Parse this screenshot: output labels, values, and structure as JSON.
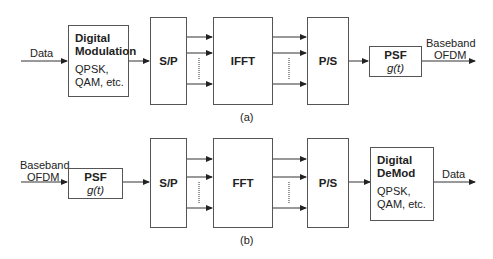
{
  "diagram_a": {
    "caption": "(a)",
    "input_label": "Data",
    "modulator": {
      "title_line1": "Digital",
      "title_line2": "Modulation",
      "sub_line1": "QPSK,",
      "sub_line2": "QAM, etc."
    },
    "sp": "S/P",
    "transform": "IFFT",
    "ps": "P/S",
    "psf": {
      "title": "PSF",
      "func": "g(t)"
    },
    "output_label_line1": "Baseband",
    "output_label_line2": "OFDM"
  },
  "diagram_b": {
    "caption": "(b)",
    "input_label_line1": "Baseband",
    "input_label_line2": "OFDM",
    "psf": {
      "title": "PSF",
      "func": "g(t)"
    },
    "sp": "S/P",
    "transform": "FFT",
    "ps": "P/S",
    "demodulator": {
      "title_line1": "Digital",
      "title_line2": "DeMod",
      "sub_line1": "QPSK,",
      "sub_line2": "QAM, etc."
    },
    "output_label": "Data"
  }
}
